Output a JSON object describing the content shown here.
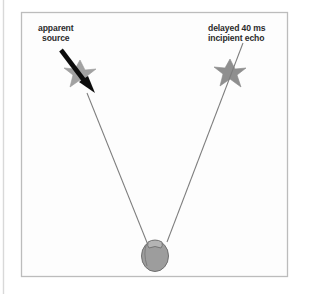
{
  "figure": {
    "name": "precedence-effect-localization-diagram",
    "background_color": "#ffffff",
    "frame": {
      "name": "figure-border",
      "color": "#b9b9b9",
      "x": 21,
      "y": 12,
      "width": 267,
      "height": 265
    },
    "page_edge_rule": {
      "name": "page-edge-rule",
      "color": "#d8d8d8",
      "x": 3,
      "y": 0,
      "height": 294
    }
  },
  "labels": {
    "apparent_source": {
      "name": "apparent-source-label",
      "lines": [
        "apparent",
        "source"
      ],
      "line1": "apparent",
      "line2": "source",
      "color": "#2b2b2b"
    },
    "delayed_echo": {
      "name": "delayed-echo-label",
      "lines": [
        "delayed 40 ms",
        "incipient echo"
      ],
      "line1": "delayed 40 ms",
      "line2": "incipient echo",
      "color": "#2b2b2b"
    }
  },
  "graphics": {
    "listener_head": {
      "name": "listener-head",
      "fill": "#9b9b9b",
      "stroke": "#6e6e6e",
      "cx": 155,
      "cy": 255,
      "rx": 14,
      "ry": 16
    },
    "left_burst": {
      "name": "left-sound-burst-star",
      "fill": "#9e9e9e",
      "cx": 80,
      "cy": 74
    },
    "right_burst": {
      "name": "right-sound-burst-star",
      "fill": "#8e8e8e",
      "cx": 230,
      "cy": 73
    },
    "apparent_source_arrow": {
      "name": "apparent-source-arrow",
      "color": "#101010",
      "x1": 62,
      "y1": 51,
      "x2": 92,
      "y2": 91
    },
    "left_ray": {
      "name": "left-sound-ray",
      "color": "#7b7b7b",
      "x1": 87,
      "y1": 93,
      "x2": 148,
      "y2": 245
    },
    "right_ray": {
      "name": "right-sound-ray",
      "color": "#7b7b7b",
      "x1": 243,
      "y1": 43,
      "x2": 167,
      "y2": 242
    }
  }
}
